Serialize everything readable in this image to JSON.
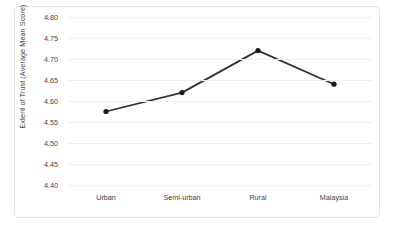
{
  "chart_data": {
    "type": "line",
    "title": "",
    "xlabel": "",
    "ylabel": "Extent of Trust (Average Mean Score)",
    "categories": [
      "Urban",
      "Semi-urban",
      "Rural",
      "Malaysia"
    ],
    "values": [
      4.575,
      4.62,
      4.72,
      4.64
    ],
    "series": [
      {
        "name": "Extent of Trust",
        "values": [
          4.575,
          4.62,
          4.72,
          4.64
        ]
      }
    ],
    "ylim": [
      4.4,
      4.8
    ],
    "ytick_labels": [
      "4.80",
      "4.75",
      "4.70",
      "4.65",
      "4.60",
      "4.55",
      "4.50",
      "4.45",
      "4.40"
    ],
    "ytick_values": [
      4.8,
      4.75,
      4.7,
      4.65,
      4.6,
      4.55,
      4.5,
      4.45,
      4.4
    ],
    "grid": true,
    "legend": "none",
    "line_color": "#333333",
    "marker_color": "#1a1a1a",
    "gridline_color": "#ededed",
    "border_color": "#e3e3e3",
    "text_color": "#3f3f3f"
  }
}
